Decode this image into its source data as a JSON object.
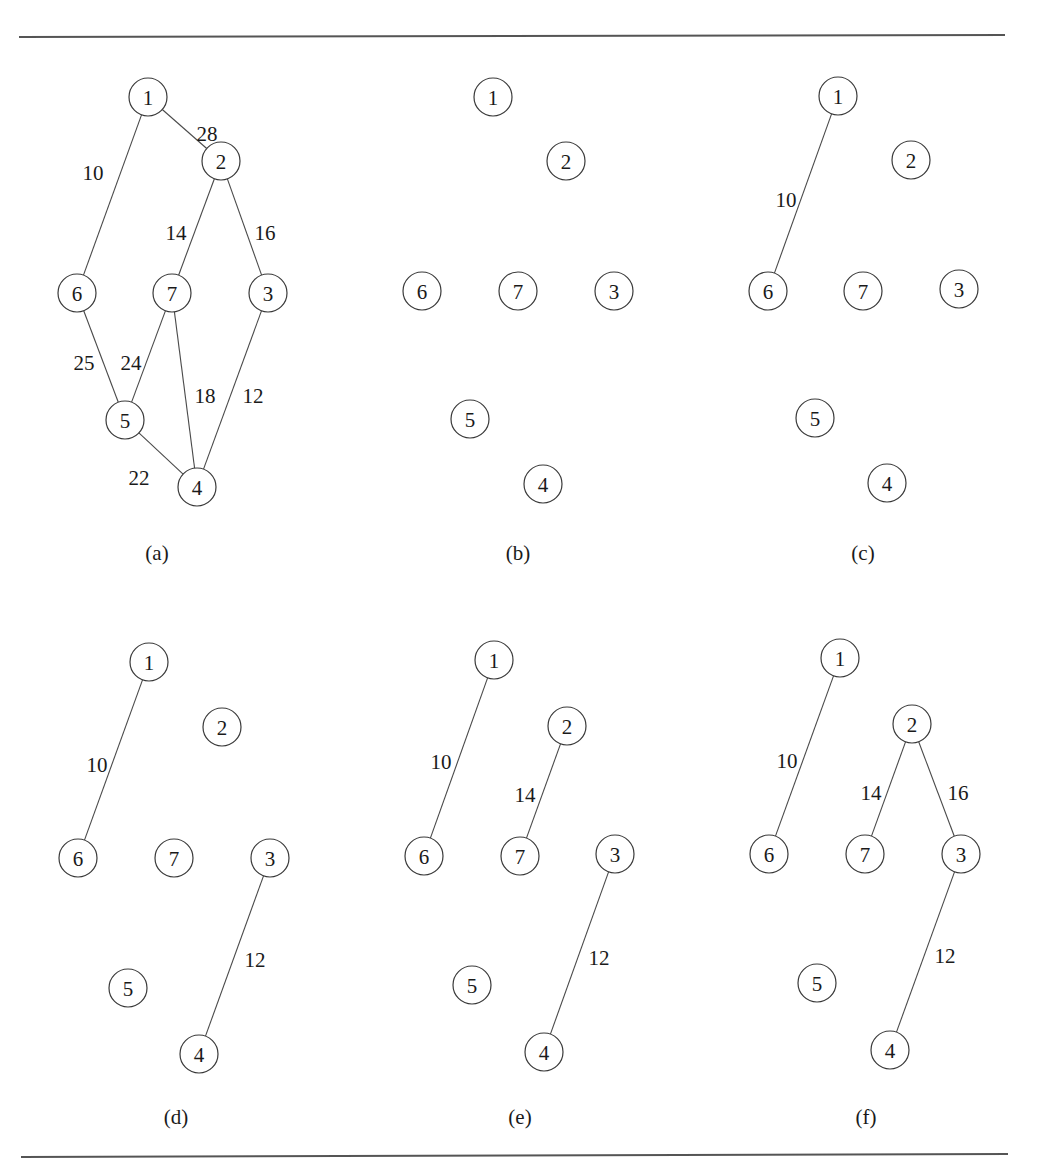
{
  "figure": {
    "rules": {
      "top": {
        "x1": 19,
        "y1": 37,
        "x2": 1005,
        "y2": 35
      },
      "bottom": {
        "x1": 21,
        "y1": 1157,
        "x2": 1008,
        "y2": 1154
      }
    },
    "node_radius": 19,
    "panels": [
      {
        "caption": "(a)",
        "caption_pos": [
          157,
          553
        ],
        "nodes": {
          "1": [
            148,
            97
          ],
          "2": [
            221,
            161
          ],
          "3": [
            268,
            293
          ],
          "4": [
            197,
            487
          ],
          "5": [
            125,
            420
          ],
          "6": [
            77,
            293
          ],
          "7": [
            172,
            293
          ]
        },
        "edges": [
          {
            "from": "1",
            "to": "2",
            "weight": "28",
            "label_pos": [
              207,
              134
            ]
          },
          {
            "from": "1",
            "to": "6",
            "weight": "10",
            "label_pos": [
              93,
              173
            ]
          },
          {
            "from": "2",
            "to": "7",
            "weight": "14",
            "label_pos": [
              176,
              233
            ]
          },
          {
            "from": "2",
            "to": "3",
            "weight": "16",
            "label_pos": [
              265,
              233
            ]
          },
          {
            "from": "6",
            "to": "5",
            "weight": "25",
            "label_pos": [
              84,
              363
            ]
          },
          {
            "from": "7",
            "to": "5",
            "weight": "24",
            "label_pos": [
              131,
              363
            ]
          },
          {
            "from": "7",
            "to": "4",
            "weight": "18",
            "label_pos": [
              205,
              396
            ]
          },
          {
            "from": "3",
            "to": "4",
            "weight": "12",
            "label_pos": [
              253,
              396
            ]
          },
          {
            "from": "5",
            "to": "4",
            "weight": "22",
            "label_pos": [
              139,
              478
            ]
          }
        ]
      },
      {
        "caption": "(b)",
        "caption_pos": [
          518,
          553
        ],
        "nodes": {
          "1": [
            493,
            97
          ],
          "2": [
            566,
            161
          ],
          "3": [
            614,
            291
          ],
          "4": [
            543,
            484
          ],
          "5": [
            470,
            419
          ],
          "6": [
            422,
            291
          ],
          "7": [
            518,
            291
          ]
        },
        "edges": []
      },
      {
        "caption": "(c)",
        "caption_pos": [
          863,
          553
        ],
        "nodes": {
          "1": [
            838,
            96
          ],
          "2": [
            911,
            160
          ],
          "3": [
            959,
            289
          ],
          "4": [
            887,
            483
          ],
          "5": [
            815,
            418
          ],
          "6": [
            768,
            291
          ],
          "7": [
            863,
            291
          ]
        },
        "edges": [
          {
            "from": "1",
            "to": "6",
            "weight": "10",
            "label_pos": [
              786,
              200
            ]
          }
        ]
      },
      {
        "caption": "(d)",
        "caption_pos": [
          176,
          1117
        ],
        "nodes": {
          "1": [
            149,
            662
          ],
          "2": [
            222,
            727
          ],
          "3": [
            270,
            858
          ],
          "4": [
            199,
            1054
          ],
          "5": [
            128,
            988
          ],
          "6": [
            78,
            858
          ],
          "7": [
            174,
            858
          ]
        },
        "edges": [
          {
            "from": "1",
            "to": "6",
            "weight": "10",
            "label_pos": [
              97,
              765
            ]
          },
          {
            "from": "3",
            "to": "4",
            "weight": "12",
            "label_pos": [
              255,
              960
            ]
          }
        ]
      },
      {
        "caption": "(e)",
        "caption_pos": [
          520,
          1117
        ],
        "nodes": {
          "1": [
            494,
            660
          ],
          "2": [
            567,
            726
          ],
          "3": [
            615,
            854
          ],
          "4": [
            544,
            1052
          ],
          "5": [
            472,
            985
          ],
          "6": [
            424,
            856
          ],
          "7": [
            520,
            856
          ]
        },
        "edges": [
          {
            "from": "1",
            "to": "6",
            "weight": "10",
            "label_pos": [
              441,
              762
            ]
          },
          {
            "from": "2",
            "to": "7",
            "weight": "14",
            "label_pos": [
              525,
              795
            ]
          },
          {
            "from": "3",
            "to": "4",
            "weight": "12",
            "label_pos": [
              599,
              958
            ]
          }
        ]
      },
      {
        "caption": "(f)",
        "caption_pos": [
          866,
          1117
        ],
        "nodes": {
          "1": [
            840,
            658
          ],
          "2": [
            912,
            724
          ],
          "3": [
            961,
            854
          ],
          "4": [
            890,
            1050
          ],
          "5": [
            817,
            983
          ],
          "6": [
            769,
            854
          ],
          "7": [
            865,
            854
          ]
        },
        "edges": [
          {
            "from": "1",
            "to": "6",
            "weight": "10",
            "label_pos": [
              787,
              761
            ]
          },
          {
            "from": "2",
            "to": "7",
            "weight": "14",
            "label_pos": [
              871,
              793
            ]
          },
          {
            "from": "2",
            "to": "3",
            "weight": "16",
            "label_pos": [
              958,
              793
            ]
          },
          {
            "from": "3",
            "to": "4",
            "weight": "12",
            "label_pos": [
              945,
              956
            ]
          }
        ]
      }
    ]
  }
}
